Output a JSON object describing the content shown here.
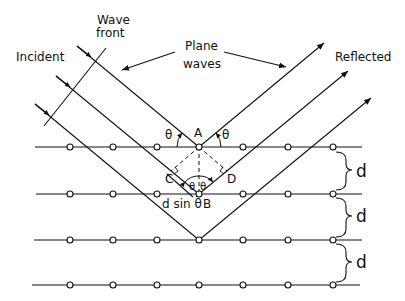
{
  "diagram": {
    "labels": {
      "wave_front": [
        "Wave",
        "front"
      ],
      "incident": "Incident",
      "plane_waves": [
        "Plane",
        "waves"
      ],
      "reflected": "Reflected",
      "theta": "θ",
      "point_a": "A",
      "point_b": "B",
      "point_c": "C",
      "point_d": "D",
      "path_diff": "d sin θ",
      "spacing": "d"
    },
    "planes": [
      {
        "y": 147
      },
      {
        "y": 194
      },
      {
        "y": 240
      },
      {
        "y": 285
      }
    ],
    "atom_x": [
      70,
      113,
      157,
      199,
      243,
      288,
      333
    ],
    "spacing_labels": [
      "d",
      "d",
      "d"
    ],
    "colors": {
      "line": "#111111",
      "background": "#ffffff"
    }
  }
}
